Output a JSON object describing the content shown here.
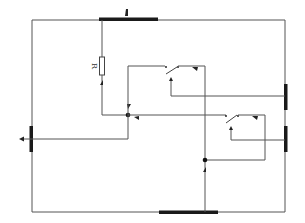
{
  "diagram": {
    "type": "electrical-circuit",
    "colors": {
      "wire": "#555555",
      "bar": "#1a1a1a",
      "background": "#ffffff"
    },
    "components": {
      "resistor": {
        "label": "R"
      },
      "switches": [
        {
          "name": "upper-switch",
          "state": "open"
        },
        {
          "name": "lower-switch",
          "state": "open"
        }
      ],
      "junctions": [
        {
          "name": "left-junction"
        },
        {
          "name": "lower-junction"
        }
      ],
      "terminal_bars": [
        {
          "name": "top-bar"
        },
        {
          "name": "bottom-bar"
        },
        {
          "name": "left-bar"
        },
        {
          "name": "right-upper-bar"
        },
        {
          "name": "right-lower-bar"
        }
      ]
    }
  }
}
